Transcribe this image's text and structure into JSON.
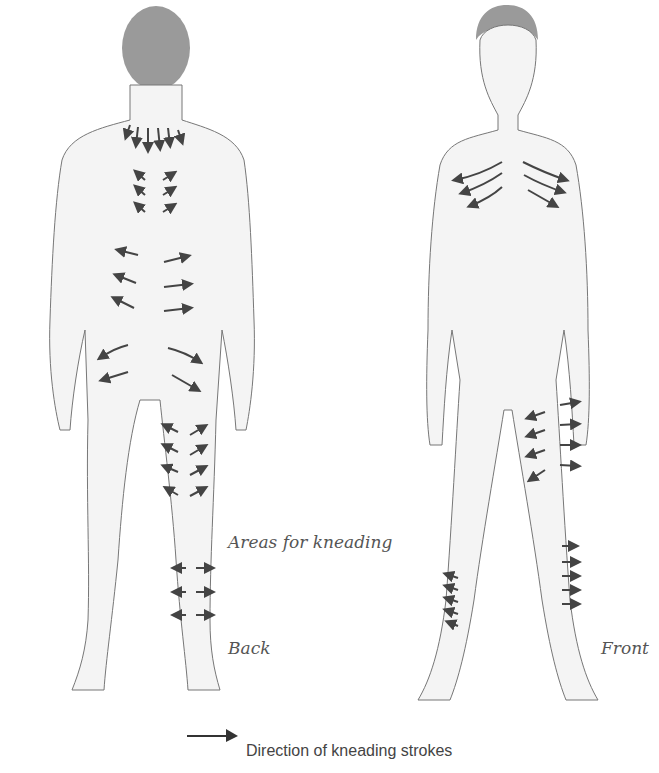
{
  "figure": {
    "labels": {
      "areas": "Areas for kneading",
      "back": "Back",
      "front": "Front"
    },
    "legend": {
      "icon": "arrow-right-icon",
      "text": "Direction of kneading strokes"
    },
    "figures": [
      {
        "name": "back-view",
        "label": "Back"
      },
      {
        "name": "front-view",
        "label": "Front"
      }
    ],
    "colors": {
      "arrow": "#444444",
      "outline": "#777777",
      "skin": "#f4f4f4",
      "hair": "#9a9a9a",
      "text": "#555555"
    }
  }
}
